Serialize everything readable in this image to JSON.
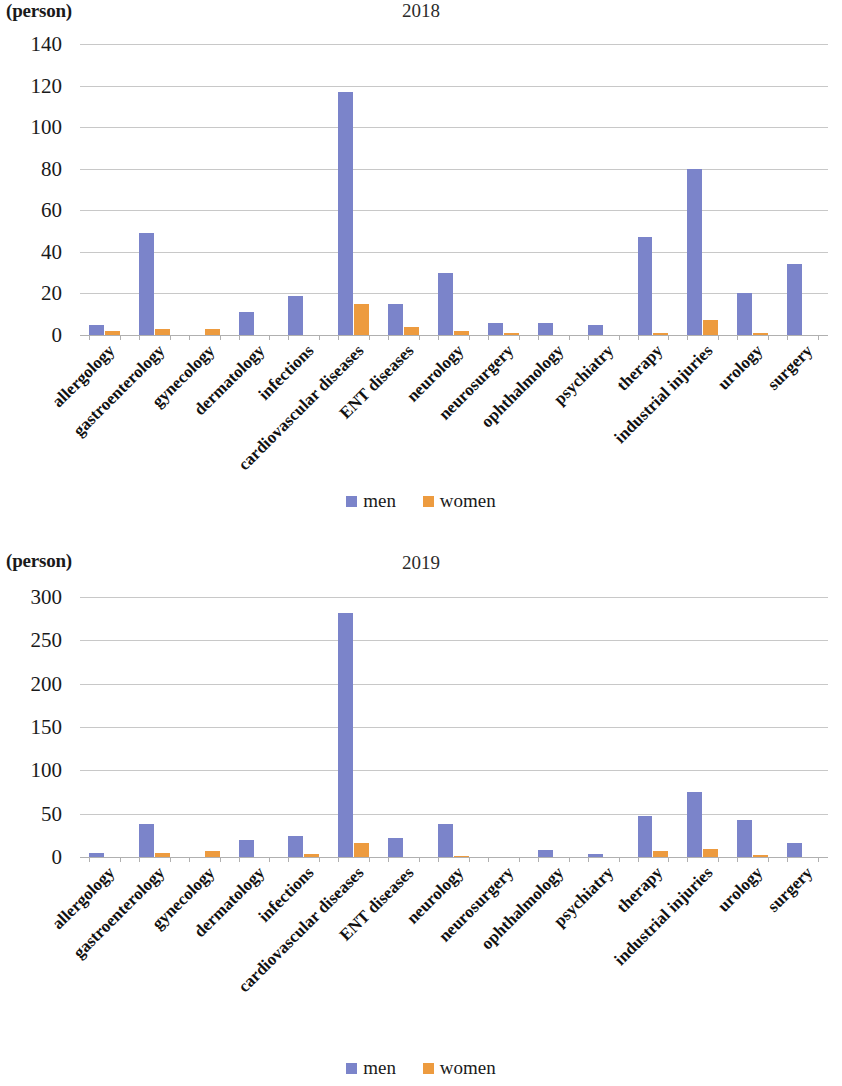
{
  "page": {
    "unit_label": "(person)"
  },
  "legend": {
    "men_label": "men",
    "women_label": "women",
    "men_color": "#7b84ca",
    "women_color": "#ed9b3f"
  },
  "categories": [
    "allergology",
    "gastroenterology",
    "gynecology",
    "dermatology",
    "infections",
    "cardiovascular diseases",
    "ENT diseases",
    "neurology",
    "neurosurgery",
    "ophthalmology",
    "psychiatry",
    "therapy",
    "industrial injuries",
    "urology",
    "surgery"
  ],
  "chart_data": [
    {
      "type": "bar",
      "title": "2018",
      "xlabel": "",
      "ylabel": "(person)",
      "ylim": [
        0,
        140
      ],
      "yticks": [
        0,
        20,
        40,
        60,
        80,
        100,
        120,
        140
      ],
      "grid": true,
      "legend_position": "bottom",
      "categories": [
        "allergology",
        "gastroenterology",
        "gynecology",
        "dermatology",
        "infections",
        "cardiovascular diseases",
        "ENT diseases",
        "neurology",
        "neurosurgery",
        "ophthalmology",
        "psychiatry",
        "therapy",
        "industrial injuries",
        "urology",
        "surgery"
      ],
      "series": [
        {
          "name": "men",
          "color": "#7b84ca",
          "values": [
            5,
            49,
            0,
            11,
            19,
            117,
            15,
            30,
            6,
            6,
            5,
            47,
            80,
            20,
            34
          ]
        },
        {
          "name": "women",
          "color": "#ed9b3f",
          "values": [
            2,
            3,
            3,
            0,
            0,
            15,
            4,
            2,
            1,
            0,
            0,
            1,
            7,
            1,
            0
          ]
        }
      ]
    },
    {
      "type": "bar",
      "title": "2019",
      "xlabel": "",
      "ylabel": "(person)",
      "ylim": [
        0,
        300
      ],
      "yticks": [
        0,
        50,
        100,
        150,
        200,
        250,
        300
      ],
      "grid": true,
      "legend_position": "bottom",
      "categories": [
        "allergology",
        "gastroenterology",
        "gynecology",
        "dermatology",
        "infections",
        "cardiovascular diseases",
        "ENT diseases",
        "neurology",
        "neurosurgery",
        "ophthalmology",
        "psychiatry",
        "therapy",
        "industrial injuries",
        "urology",
        "surgery"
      ],
      "series": [
        {
          "name": "men",
          "color": "#7b84ca",
          "values": [
            5,
            38,
            0,
            20,
            24,
            282,
            22,
            38,
            0,
            8,
            3,
            47,
            75,
            43,
            16
          ]
        },
        {
          "name": "women",
          "color": "#ed9b3f",
          "values": [
            0,
            5,
            7,
            0,
            3,
            16,
            0,
            1,
            0,
            0,
            0,
            7,
            9,
            2,
            0
          ]
        }
      ]
    }
  ]
}
